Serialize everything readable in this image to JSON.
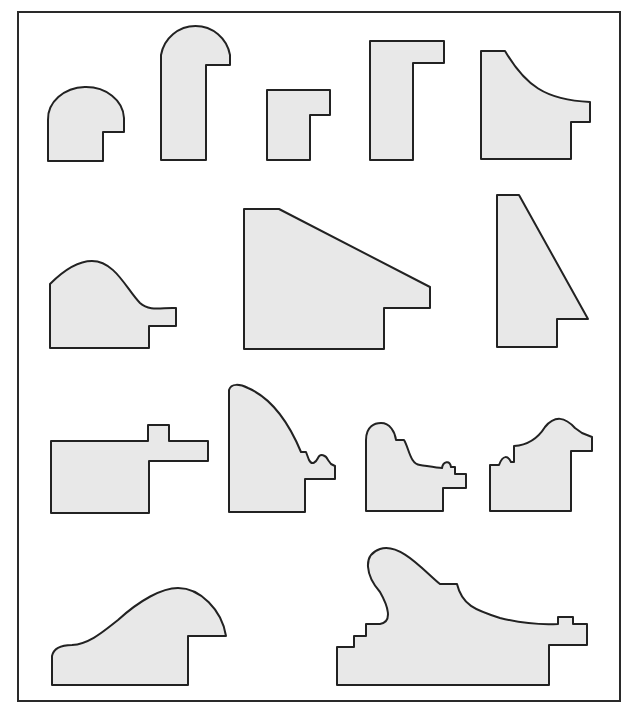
{
  "diagram": {
    "colors": {
      "fill": "#e8e8e8",
      "stroke": "#222222",
      "background": "#ffffff",
      "frame": "#2a2a2a"
    },
    "rows": [
      {
        "row": 1,
        "profiles": [
          "quarter-round-rabbet",
          "tall-round-top-rabbet",
          "small-l-rabbet",
          "tall-l-rabbet",
          "concave-cove-rabbet"
        ]
      },
      {
        "row": 2,
        "profiles": [
          "ogee-hump-rabbet",
          "wide-slope-rabbet",
          "tall-taper-rabbet"
        ]
      },
      {
        "row": 3,
        "profiles": [
          "flat-cap-tongue-rabbet",
          "quarter-ellipse-bead-rabbet",
          "ornate-scoop-rabbet",
          "ornate-crest-rabbet"
        ]
      },
      {
        "row": 4,
        "profiles": [
          "low-swept-hump-rabbet",
          "wide-ornate-wave-rabbet"
        ]
      }
    ]
  }
}
